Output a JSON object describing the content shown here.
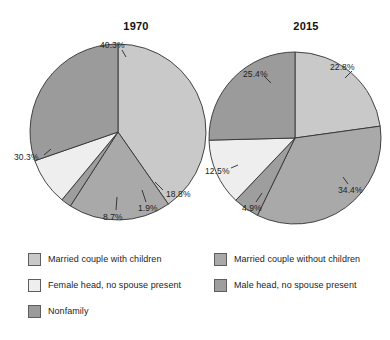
{
  "chart_data": [
    {
      "type": "pie",
      "title": "1970",
      "categories": [
        "Married couple with children",
        "Married couple without children",
        "Male head, no spouse present",
        "Female head, no spouse present",
        "Nonfamily"
      ],
      "values": [
        40.3,
        18.8,
        1.9,
        8.7,
        30.3
      ],
      "labels": [
        "40.3%",
        "18.8%",
        "1.9%",
        "8.7%",
        "30.3%"
      ],
      "colors": [
        "#c9c9c9",
        "#a9a9a9",
        "#9e9e9e",
        "#eeeeee",
        "#9b9b9b"
      ],
      "start_angle_deg": 0,
      "direction": "clockwise",
      "legend": "below",
      "grid": false
    },
    {
      "type": "pie",
      "title": "2015",
      "categories": [
        "Married couple with children",
        "Married couple without children",
        "Male head, no spouse present",
        "Female head, no spouse present",
        "Nonfamily"
      ],
      "values": [
        22.8,
        34.4,
        4.9,
        12.5,
        25.4
      ],
      "labels": [
        "22.8%",
        "34.4%",
        "4.9%",
        "12.5%",
        "25.4%"
      ],
      "colors": [
        "#c9c9c9",
        "#a9a9a9",
        "#9e9e9e",
        "#eeeeee",
        "#9b9b9b"
      ],
      "start_angle_deg": 0,
      "direction": "clockwise",
      "legend": "below",
      "grid": false
    }
  ],
  "titles": {
    "left": "1970",
    "right": "2015"
  },
  "pie_1970_labels": {
    "married_with_children": "40.3%",
    "married_without_children": "18.8%",
    "male_head": "1.9%",
    "female_head": "8.7%",
    "nonfamily": "30.3%"
  },
  "pie_2015_labels": {
    "married_with_children": "22.8%",
    "married_without_children": "34.4%",
    "male_head": "4.9%",
    "female_head": "12.5%",
    "nonfamily": "25.4%"
  },
  "legend": {
    "left_column": [
      {
        "label": "Married couple with children",
        "color": "#c9c9c9"
      },
      {
        "label": "Female head, no spouse present",
        "color": "#eeeeee"
      },
      {
        "label": "Nonfamily",
        "color": "#9b9b9b"
      }
    ],
    "right_column": [
      {
        "label": "Married couple without children",
        "color": "#a9a9a9"
      },
      {
        "label": "Male head, no spouse present",
        "color": "#9e9e9e"
      }
    ]
  }
}
